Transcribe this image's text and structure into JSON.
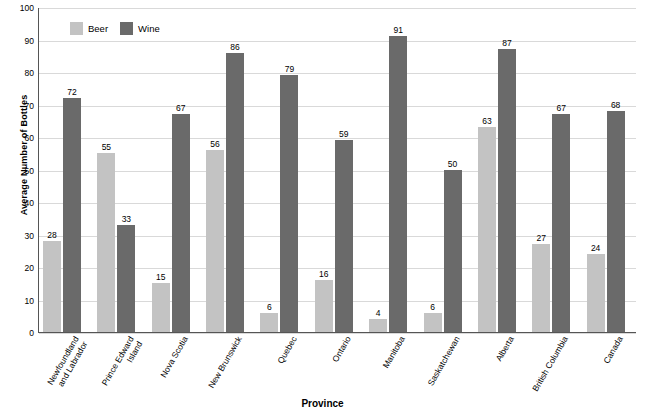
{
  "chart_data": {
    "type": "bar",
    "title": "",
    "xlabel": "Province",
    "ylabel": "Average Number of Bottles",
    "ylim": [
      0,
      100
    ],
    "yticks": [
      0,
      10,
      20,
      30,
      40,
      50,
      60,
      70,
      80,
      90,
      100
    ],
    "grid": true,
    "legend_position": "top-left",
    "categories": [
      "Newfoundland\nand Labrador",
      "Prince Edward\nIsland",
      "Nova Scotia",
      "New Brunswick",
      "Quebec",
      "Ontario",
      "Manitoba",
      "Saskatchewan",
      "Alberta",
      "British Columbia",
      "Canada"
    ],
    "category_lines": [
      [
        "Newfoundland",
        "and Labrador"
      ],
      [
        "Prince Edward",
        "Island"
      ],
      [
        "Nova Scotia"
      ],
      [
        "New Brunswick"
      ],
      [
        "Quebec"
      ],
      [
        "Ontario"
      ],
      [
        "Manitoba"
      ],
      [
        "Saskatchewan"
      ],
      [
        "Alberta"
      ],
      [
        "British Columbia"
      ],
      [
        "Canada"
      ]
    ],
    "series": [
      {
        "name": "Beer",
        "color": "#c3c3c3",
        "values": [
          28,
          55,
          15,
          56,
          6,
          16,
          4,
          6,
          63,
          27,
          24
        ]
      },
      {
        "name": "Wine",
        "color": "#6a6a6a",
        "values": [
          72,
          33,
          67,
          86,
          79,
          59,
          91,
          50,
          87,
          67,
          68
        ]
      }
    ]
  },
  "legend": {
    "items": [
      {
        "label": "Beer",
        "color": "#c3c3c3"
      },
      {
        "label": "Wine",
        "color": "#6a6a6a"
      }
    ]
  },
  "axes": {
    "y_title": "Average Number of Bottles",
    "x_title": "Province"
  }
}
